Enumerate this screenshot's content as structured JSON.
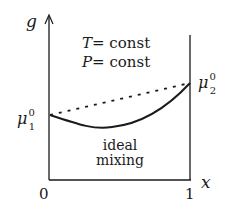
{
  "diagram": {
    "axes": {
      "y_label": "g",
      "x_label": "x",
      "x_ticks": [
        "0",
        "1"
      ]
    },
    "conditions": {
      "line1_var": "T",
      "line1_rest": "= const",
      "line2_var": "P",
      "line2_rest": "= const"
    },
    "endpoints": {
      "left": {
        "symbol": "μ",
        "sup": "0",
        "sub": "1"
      },
      "right": {
        "symbol": "μ",
        "sup": "0",
        "sub": "2"
      }
    },
    "curve_label": {
      "line1": "ideal",
      "line2": "mixing"
    },
    "colors": {
      "ink": "#1a1a1a",
      "background": "#ffffff"
    }
  }
}
